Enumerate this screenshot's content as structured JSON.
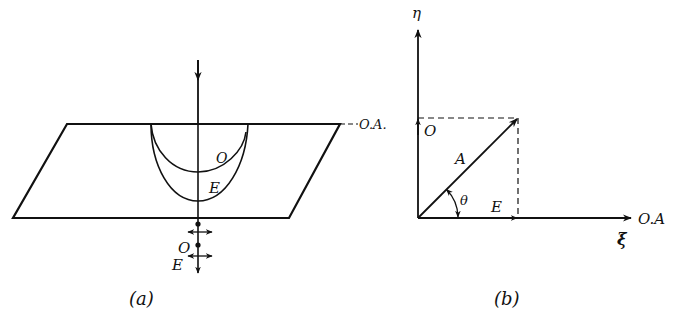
{
  "colors": {
    "ink": "#111111",
    "background": "#ffffff"
  },
  "panel_a": {
    "caption": "(a)",
    "wavefront_labels": {
      "ordinary": "O",
      "extraordinary": "E"
    },
    "output_labels": {
      "ordinary": "O",
      "extraordinary": "E"
    },
    "optic_axis_label": "O.A."
  },
  "panel_b": {
    "caption": "(b)",
    "axis_eta_label": "η",
    "axis_xi_label": "ξ",
    "optic_axis_label": "O.A",
    "vector_label": "A",
    "ordinary_component_label": "O",
    "extraordinary_component_label": "E",
    "angle_label": "θ"
  }
}
